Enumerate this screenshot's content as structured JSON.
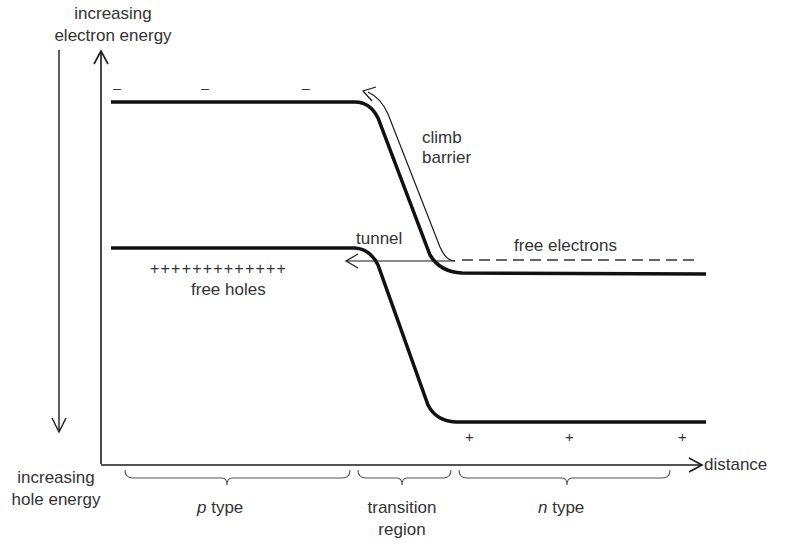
{
  "diagram": {
    "type": "energy-band diagram of p-n junction (tunnel diode)",
    "axes": {
      "y_top_label_line1": "increasing",
      "y_top_label_line2": "electron energy",
      "y_bottom_label_line1": "increasing",
      "y_bottom_label_line2": "hole energy",
      "x_label": "distance"
    },
    "annotations": {
      "climb_line1": "climb",
      "climb_line2": "barrier",
      "tunnel": "tunnel",
      "free_electrons": "free electrons",
      "free_holes": "free holes",
      "holes_plus_row": "+++++++++++++",
      "minus_sign": "–",
      "plus_sign": "+"
    },
    "regions": {
      "p_prefix": "p",
      "p_suffix": " type",
      "transition_line1": "transition",
      "transition_line2": "region",
      "n_prefix": "n",
      "n_suffix": " type"
    },
    "colors": {
      "ink": "#1a1a1a",
      "text": "#333333",
      "background": "#ffffff"
    }
  }
}
